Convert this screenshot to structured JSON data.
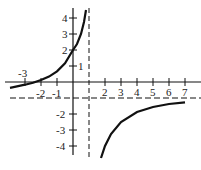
{
  "graph": {
    "function": "y = (x+2)/(1-x)",
    "vertical_asymptote": "x = 1",
    "horizontal_asymptote": "y = -1",
    "x_tick_labels": [
      "-3",
      "-2",
      "-1",
      "2",
      "3",
      "4",
      "5",
      "6",
      "7"
    ],
    "y_tick_labels": [
      "4",
      "3",
      "2",
      "1",
      "-2",
      "-3",
      "-4"
    ],
    "marked_points": [
      [
        0,
        2
      ],
      [
        -2,
        0
      ]
    ]
  }
}
